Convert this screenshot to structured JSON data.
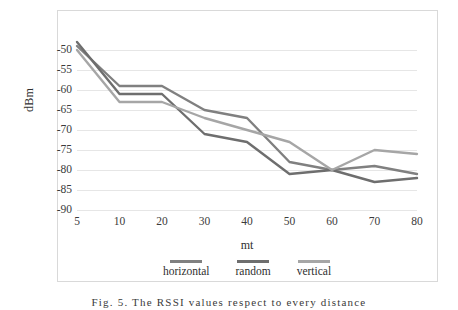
{
  "figure": {
    "caption": "Fig. 5. The RSSI values respect to every distance"
  },
  "chart_data": {
    "type": "line",
    "title": "",
    "xlabel": "mt",
    "ylabel": "dBm",
    "categories": [
      "5",
      "10",
      "20",
      "30",
      "40",
      "50",
      "60",
      "70",
      "80"
    ],
    "ylim": [
      -90,
      -45
    ],
    "yticks": [
      "-50",
      "-55",
      "-60",
      "-65",
      "-70",
      "-75",
      "-80",
      "-85",
      "-90"
    ],
    "ytick_values": [
      -50,
      -55,
      -60,
      -65,
      -70,
      -75,
      -80,
      -85,
      -90
    ],
    "grid": "horizontal",
    "legend_position": "bottom",
    "series": [
      {
        "name": "horizontal",
        "color": "#808080",
        "values": [
          -49,
          -59,
          -59,
          -65,
          -67,
          -78,
          -80,
          -79,
          -81
        ]
      },
      {
        "name": "random",
        "color": "#6e6e6e",
        "values": [
          -48,
          -61,
          -61,
          -71,
          -73,
          -81,
          -80,
          -83,
          -82
        ]
      },
      {
        "name": "vertical",
        "color": "#a6a6a6",
        "values": [
          -50,
          -63,
          -63,
          -67,
          -70,
          -73,
          -80,
          -75,
          -76
        ]
      }
    ]
  },
  "colors": {
    "gridline": "#e6e6e6",
    "frame": "#d9d9d9",
    "text": "#2f2f2f",
    "background": "#ffffff"
  }
}
